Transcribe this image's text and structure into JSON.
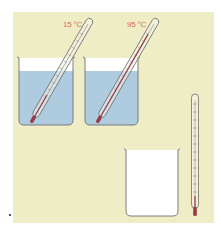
{
  "figure": {
    "colors": {
      "background": "#efedc6",
      "water": "#aecbe0",
      "glass_outline": "#6f6f6f",
      "liquid_column": "#9b3a4a",
      "label": "#d9695a"
    }
  },
  "beakers": [
    {
      "id": "cold",
      "contents": "water",
      "thermometer_label": "15 °C"
    },
    {
      "id": "hot",
      "contents": "water",
      "thermometer_label": "95 °C"
    },
    {
      "id": "empty",
      "contents": "empty"
    }
  ],
  "loose_thermometer": {
    "orientation": "vertical"
  }
}
